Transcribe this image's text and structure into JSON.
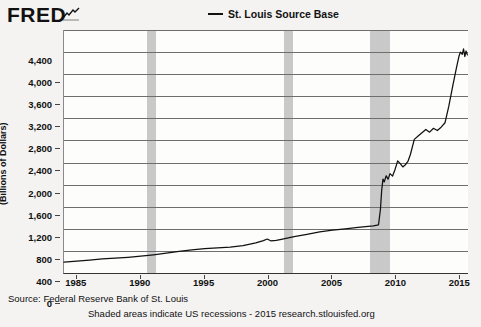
{
  "header": {
    "brand": "FRED",
    "brand_mark_icon": "fred-squiggle-icon"
  },
  "legend": {
    "entries": [
      {
        "label": "St. Louis Source Base",
        "color": "#111111"
      }
    ]
  },
  "footer": {
    "source": "Source: Federal Reserve Bank of St. Louis",
    "note": "Shaded areas indicate US recessions - 2015 research.stlouisfed.org"
  },
  "chart_data": {
    "type": "line",
    "title": "",
    "xlabel": "",
    "ylabel": "(Billions of Dollars)",
    "xlim": [
      1984,
      2015.6
    ],
    "ylim": [
      0,
      4400
    ],
    "grid": true,
    "legend_position": "top-center",
    "yticks": [
      0,
      400,
      800,
      1200,
      1600,
      2000,
      2400,
      2800,
      3200,
      3600,
      4000,
      4400
    ],
    "ytick_labels": [
      "0",
      "400",
      "800",
      "1,200",
      "1,600",
      "2,000",
      "2,400",
      "2,800",
      "3,200",
      "3,600",
      "4,000",
      "4,400"
    ],
    "xticks": [
      1985,
      1990,
      1995,
      2000,
      2005,
      2010,
      2015
    ],
    "xtick_labels": [
      "1985",
      "1990",
      "1995",
      "2000",
      "2005",
      "2010",
      "2015"
    ],
    "shaded_regions": [
      {
        "label": "recession-1990",
        "x0": 1990.5,
        "x1": 1991.2
      },
      {
        "label": "recession-2001",
        "x0": 2001.2,
        "x1": 2001.9
      },
      {
        "label": "recession-2008",
        "x0": 2007.9,
        "x1": 2009.5
      },
      {
        "label": "recession-color",
        "color": "#c9c9c9"
      }
    ],
    "series": [
      {
        "name": "St. Louis Source Base",
        "color": "#111111",
        "x": [
          1984.0,
          1985.0,
          1986.0,
          1987.0,
          1988.0,
          1989.0,
          1990.0,
          1991.0,
          1992.0,
          1993.0,
          1994.0,
          1995.0,
          1996.0,
          1997.0,
          1998.0,
          1999.0,
          1999.6,
          1999.9,
          2000.2,
          2000.6,
          2001.0,
          2002.0,
          2003.0,
          2004.0,
          2005.0,
          2006.0,
          2007.0,
          2007.8,
          2008.2,
          2008.6,
          2008.75,
          2008.85,
          2008.95,
          2009.05,
          2009.2,
          2009.35,
          2009.5,
          2009.7,
          2009.9,
          2010.1,
          2010.3,
          2010.5,
          2010.7,
          2010.9,
          2011.1,
          2011.4,
          2011.7,
          2012.0,
          2012.3,
          2012.6,
          2012.9,
          2013.2,
          2013.5,
          2013.8,
          2014.1,
          2014.4,
          2014.7,
          2014.9,
          2015.0,
          2015.15,
          2015.25,
          2015.35,
          2015.45,
          2015.55
        ],
        "y": [
          195,
          215,
          235,
          255,
          270,
          285,
          305,
          330,
          360,
          390,
          420,
          440,
          455,
          470,
          495,
          545,
          585,
          615,
          580,
          590,
          610,
          660,
          700,
          745,
          775,
          800,
          825,
          845,
          855,
          870,
          1150,
          1500,
          1700,
          1650,
          1760,
          1700,
          1800,
          1755,
          1880,
          2030,
          1980,
          1920,
          1960,
          2020,
          2150,
          2420,
          2480,
          2540,
          2600,
          2550,
          2620,
          2580,
          2640,
          2720,
          3020,
          3380,
          3720,
          3930,
          4000,
          3960,
          4060,
          3920,
          4020,
          3950
        ]
      }
    ]
  }
}
